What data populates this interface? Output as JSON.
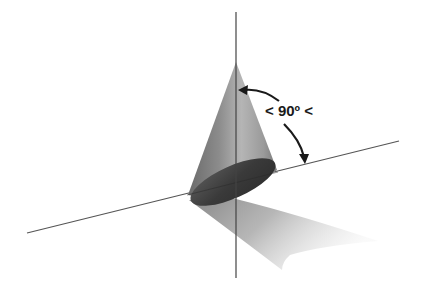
{
  "diagram": {
    "type": "3d-geometry-illustration",
    "angle_label": "< 90º <",
    "angle_value": "90º",
    "elements": {
      "vertical_axis": {
        "x": 236,
        "y1": 12,
        "y2": 278
      },
      "horizontal_axis": {
        "x1": 27,
        "y1": 233,
        "x2": 399,
        "y2": 141
      },
      "cone": {
        "apex": [
          236,
          62
        ],
        "base_center": [
          233,
          182
        ]
      },
      "shadow": {
        "direction": "lower-right"
      }
    },
    "colors": {
      "background": "#ffffff",
      "axis": "#555555",
      "cone_light": "#c8c8c8",
      "cone_dark": "#4a4a4a",
      "base": "#3c3c3c",
      "shadow": "#9a9a9a",
      "arrow": "#1a1a1a"
    }
  }
}
